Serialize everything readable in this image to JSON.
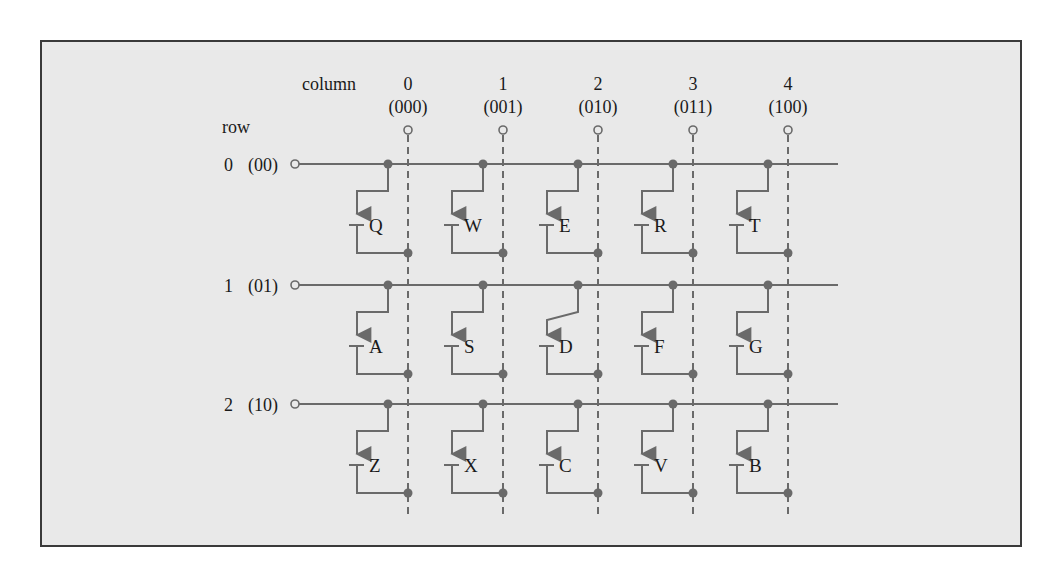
{
  "colors": {
    "page_background": "#ffffff",
    "panel_background": "#e9e9e9",
    "panel_border": "#3a3a3a",
    "wire": "#6a6a6a",
    "text": "#1a1a1a"
  },
  "diagram": {
    "column_header": "column",
    "row_header": "row",
    "columns": [
      {
        "index": "0",
        "code": "(000)"
      },
      {
        "index": "1",
        "code": "(001)"
      },
      {
        "index": "2",
        "code": "(010)"
      },
      {
        "index": "3",
        "code": "(011)"
      },
      {
        "index": "4",
        "code": "(100)"
      }
    ],
    "rows": [
      {
        "index": "0",
        "code": "(00)",
        "keys": [
          "Q",
          "W",
          "E",
          "R",
          "T"
        ]
      },
      {
        "index": "1",
        "code": "(01)",
        "keys": [
          "A",
          "S",
          "D",
          "F",
          "G"
        ]
      },
      {
        "index": "2",
        "code": "(10)",
        "keys": [
          "Z",
          "X",
          "C",
          "V",
          "B"
        ]
      }
    ],
    "pressed_key": "D"
  }
}
